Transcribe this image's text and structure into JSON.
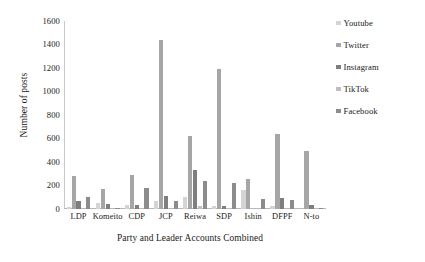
{
  "chart_data": {
    "type": "bar",
    "title": "",
    "subtitle": "",
    "xlabel": "Party and Leader Accounts Combined",
    "ylabel": "Number of posts",
    "categories": [
      "LDP",
      "Komeito",
      "CDP",
      "JCP",
      "Reiwa",
      "SDP",
      "Ishin",
      "DFPF",
      "N-to"
    ],
    "series": [
      {
        "name": "Youtube",
        "color": "#d4d4d4",
        "values": [
          15,
          52,
          30,
          68,
          100,
          25,
          165,
          25,
          0
        ]
      },
      {
        "name": "Twitter",
        "color": "#a6a6a6",
        "values": [
          278,
          168,
          288,
          1440,
          625,
          1190,
          258,
          635,
          490
        ]
      },
      {
        "name": "Instagram",
        "color": "#7f7f7f",
        "values": [
          72,
          42,
          35,
          115,
          330,
          28,
          0,
          90,
          38
        ]
      },
      {
        "name": "TikTok",
        "color": "#bfbfbf",
        "values": [
          0,
          0,
          0,
          0,
          25,
          0,
          0,
          0,
          0
        ]
      },
      {
        "name": "Facebook",
        "color": "#8c8c8c",
        "values": [
          102,
          12,
          175,
          68,
          235,
          222,
          85,
          78,
          5
        ]
      }
    ],
    "ylim": [
      0,
      1600
    ],
    "ytick_step": 200,
    "yticks": [
      "1600",
      "1400",
      "1200",
      "1000",
      "800",
      "600",
      "400",
      "200",
      "0"
    ],
    "grid": false,
    "legend_position": "right"
  }
}
